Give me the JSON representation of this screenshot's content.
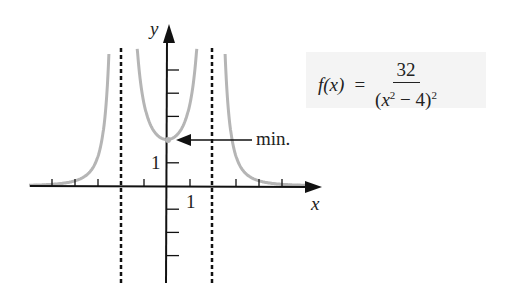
{
  "chart_data": {
    "type": "line",
    "title": "",
    "function": "f(x) = 32 / (x^2 - 4)^2",
    "xlabel": "x",
    "ylabel": "y",
    "x_tick_label": "1",
    "y_tick_label": "1",
    "vertical_asymptotes": [
      -2,
      2
    ],
    "horizontal_asymptote": 0,
    "annotations": [
      {
        "text": "min.",
        "point": [
          0,
          2
        ]
      }
    ],
    "xlim": [
      -6,
      6.5
    ],
    "ylim": [
      -4,
      5.5
    ],
    "grid": false,
    "series": [
      {
        "name": "f(x)",
        "color": "#b5b5b5"
      }
    ]
  },
  "formula": {
    "lhs": "f(x)",
    "eq": "=",
    "numerator": "32",
    "den_open": "(",
    "den_var": "x",
    "den_exp": "2",
    "den_rest": " − 4)",
    "den_outer_exp": "2"
  },
  "labels": {
    "x_axis": "x",
    "y_axis": "y",
    "x_tick": "1",
    "y_tick": "1",
    "min": "min."
  },
  "colors": {
    "curve": "#b5b5b5",
    "axes": "#111111",
    "formula_bg": "#f4f4f4"
  }
}
